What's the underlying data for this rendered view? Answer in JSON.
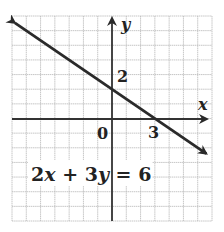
{
  "chart_data": {
    "type": "line",
    "title": "",
    "xlabel": "x",
    "ylabel": "y",
    "xlim": [
      -7,
      7
    ],
    "ylim": [
      -7,
      7
    ],
    "grid": true,
    "grid_step": 1,
    "origin_label": "0",
    "tick_labels": [
      {
        "axis": "y",
        "value": 2,
        "label": "2"
      },
      {
        "axis": "x",
        "value": 3,
        "label": "3"
      }
    ],
    "series": [
      {
        "name": "2x + 3y = 6",
        "equation": "2x + 3y = 6",
        "slope": -0.6667,
        "y_intercept": 2,
        "x_intercept": 3,
        "x": [
          -6.8,
          6.6
        ],
        "y": [
          6.53,
          -2.4
        ],
        "arrows": "both"
      }
    ],
    "annotations": [
      {
        "text": "2x + 3y = 6",
        "x": -5,
        "y": -3
      }
    ]
  },
  "labels": {
    "x_axis": "x",
    "y_axis": "y",
    "origin": "0",
    "y_tick": "2",
    "x_tick": "3",
    "eq_part1": "2",
    "eq_var1": "x",
    "eq_part2": " + 3",
    "eq_var2": "y",
    "eq_part3": " = 6"
  },
  "colors": {
    "grid": "#b8b8b8",
    "axis": "#333333",
    "line": "#2a2a2a"
  }
}
